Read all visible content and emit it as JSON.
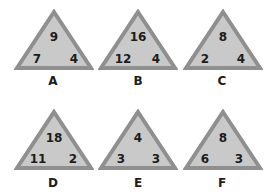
{
  "colors": {
    "fill": "#c9c9c9",
    "border": "#8f8f8f",
    "text": "#1c1c1c"
  },
  "triangles": [
    {
      "label": "A",
      "top": "9",
      "left": "7",
      "right": "4"
    },
    {
      "label": "B",
      "top": "16",
      "left": "12",
      "right": "4"
    },
    {
      "label": "C",
      "top": "8",
      "left": "2",
      "right": "4"
    },
    {
      "label": "D",
      "top": "18",
      "left": "11",
      "right": "2"
    },
    {
      "label": "E",
      "top": "4",
      "left": "3",
      "right": "3"
    },
    {
      "label": "F",
      "top": "8",
      "left": "6",
      "right": "3"
    }
  ]
}
